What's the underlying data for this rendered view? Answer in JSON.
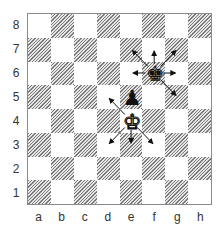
{
  "diagram": {
    "type": "chess-board",
    "files": [
      "a",
      "b",
      "c",
      "d",
      "e",
      "f",
      "g",
      "h"
    ],
    "ranks": [
      "8",
      "7",
      "6",
      "5",
      "4",
      "3",
      "2",
      "1"
    ],
    "colors": {
      "dark_hatch": "#7a7a7a",
      "light": "#ffffff",
      "border": "#8a8a8a",
      "arrow": "#111111"
    },
    "pieces": [
      {
        "square": "f6",
        "color": "black",
        "type": "king",
        "glyph": "♚"
      },
      {
        "square": "e5",
        "color": "black",
        "type": "pawn",
        "glyph": "♟"
      },
      {
        "square": "e4",
        "color": "white",
        "type": "king",
        "glyph": "♚"
      }
    ],
    "arrows": [
      {
        "from": "f6",
        "to": "e7"
      },
      {
        "from": "f6",
        "to": "f7"
      },
      {
        "from": "f6",
        "to": "g7"
      },
      {
        "from": "f6",
        "to": "e6"
      },
      {
        "from": "f6",
        "to": "g6"
      },
      {
        "from": "f6",
        "to": "g5"
      },
      {
        "from": "e4",
        "to": "d5"
      },
      {
        "from": "e4",
        "to": "d3"
      },
      {
        "from": "e4",
        "to": "e3"
      },
      {
        "from": "e4",
        "to": "f3"
      }
    ]
  }
}
